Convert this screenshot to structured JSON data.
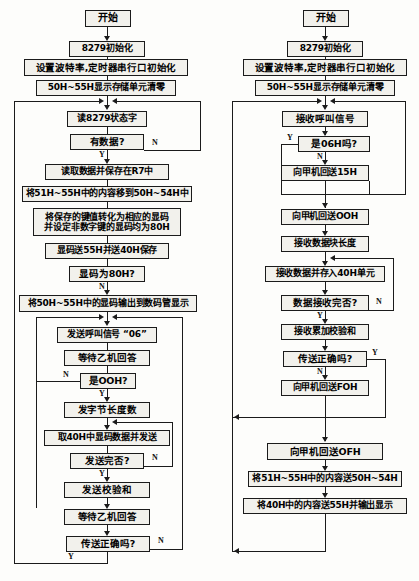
{
  "figure": {
    "type": "flowchart",
    "orientation": "two-column",
    "columns": [
      {
        "name": "left",
        "title": "甲机（发送）流程"
      },
      {
        "name": "right",
        "title": "乙机（接收）流程"
      }
    ]
  },
  "left": {
    "nodes": {
      "start": "开始",
      "init8279": "8279初始化",
      "baud_init": "设置波特率,定时器串行口初始化",
      "clear_disp": "50H~55H显示存储单元清零",
      "read_status": "读8279状态字",
      "has_data": "有数据?",
      "read_save_r7": "读取数据并保存在R7中",
      "shift_51_55": "将51H~55H中的内容移到50H~54H中",
      "key_to_code": "将保存的键值转化为相应的显码\n并设定非数字键的显码均为80H",
      "code_to_55_40": "显码送55H并送40H保存",
      "is_code_80h": "显码为80H?",
      "output_display": "将50H~55H中的显码输出到数码管显示",
      "send_call_06": "发送呼叫信号 “06”",
      "wait_reply": "等待乙机回答",
      "is_00h": "是OOH?",
      "send_len": "发字节长度数",
      "take_40h_send": "取40H中显码数据并发送",
      "send_done": "发送完否?",
      "send_checksum": "发送校验和",
      "wait_reply2": "等待乙机回答",
      "trans_ok": "传送正确吗?"
    },
    "labels": {
      "has_data_n": "N",
      "has_data_y": "Y",
      "is_code_80h_n": "N",
      "is_00h_n": "N",
      "is_00h_y": "Y",
      "send_done_n": "N",
      "send_done_y": "Y",
      "trans_ok_n": "N",
      "trans_ok_y": "Y"
    }
  },
  "right": {
    "nodes": {
      "start": "开始",
      "init8279": "8279初始化",
      "baud_init": "设置波特率,定时器串行口初始化",
      "clear_disp": "50H~55H显示存储单元清零",
      "recv_call": "接收呼叫信号",
      "is_06h": "是06H吗?",
      "send_15h": "向甲机回送15H",
      "send_00h": "向甲机回送OOH",
      "recv_len": "接收数据块长度",
      "recv_store_40h": "接收数据并存入40H单元",
      "recv_done": "数据接收完否?",
      "recv_checksum": "接收累加校验和",
      "trans_ok": "传送正确吗?",
      "send_f0h": "向甲机回送FOH",
      "send_0fh": "向甲机回送OFH",
      "move_51_55": "将51H~55H中的内容送50H~54H",
      "move_40h": "将40H中的内容送55H并输出显示"
    },
    "labels": {
      "is_06h_y": "Y",
      "is_06h_n": "N",
      "recv_done_n": "N",
      "recv_done_y": "Y",
      "trans_ok_y": "Y",
      "trans_ok_n": "N"
    }
  },
  "style": {
    "line_color": "#1b1b1b",
    "box_fill": "#f2f1ec",
    "text_color": "#000000",
    "page_bg": "#fdfdfb"
  }
}
